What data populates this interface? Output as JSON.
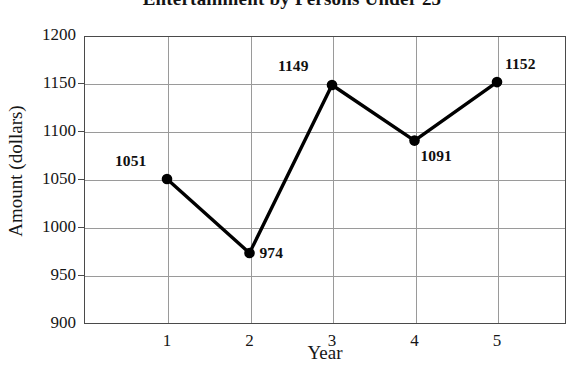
{
  "chart_data": {
    "type": "line",
    "title": "Entertainment by Persons Under 25",
    "xlabel": "Year",
    "ylabel": "Amount (dollars)",
    "x": [
      1,
      2,
      3,
      4,
      5
    ],
    "categories": [
      "1",
      "2",
      "3",
      "4",
      "5"
    ],
    "values": [
      1051,
      974,
      1149,
      1091,
      1152
    ],
    "point_labels": [
      "1051",
      "974",
      "1149",
      "1091",
      "1152"
    ],
    "ylim": [
      900,
      1200
    ],
    "yticks": [
      1200,
      1150,
      1100,
      1050,
      1000,
      950,
      900
    ],
    "ytick_labels": [
      "1200",
      "1150",
      "1100",
      "1050",
      "1000",
      "950",
      "900"
    ],
    "xtick_labels": [
      "1",
      "2",
      "3",
      "4",
      "5"
    ],
    "grid": true,
    "legend": null,
    "series_color": "#000000",
    "grid_color": "#9a9a9a",
    "frame_color": "#4a4a4a",
    "marker": "filled-circle"
  },
  "axis": {
    "y_title": "Amount (dollars)",
    "x_title": "Year"
  },
  "header": {
    "title": "Entertainment by Persons Under 25"
  }
}
